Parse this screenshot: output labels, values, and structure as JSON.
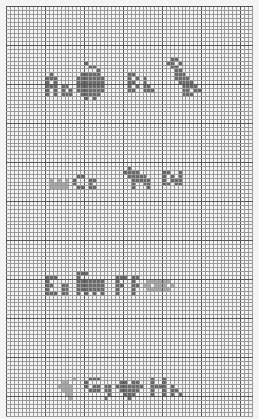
{
  "pattern": {
    "title": "Cross-stitch alphabet sampler A–H",
    "grid": {
      "cols": 63,
      "rows": 105,
      "cell_px": 3.9,
      "origin_x": 6,
      "origin_y": 6,
      "minor_line_color": "#9a9a9a",
      "major_line_color": "#555555",
      "major_every": 10,
      "background": "#f4f4f4"
    },
    "stitch_colors": {
      "dark": "#6a6a6a",
      "medium": "#8a8a8a",
      "light": "#a9a9a9"
    },
    "motifs": [
      {
        "letter_pair": "Aa",
        "picture": "apple",
        "picture_icon": "apple-icon"
      },
      {
        "letter_pair": "Bb",
        "picture": "bird",
        "picture_icon": "bird-icon"
      },
      {
        "letter_pair": "Cc",
        "picture": "crown",
        "picture_icon": "crown-icon"
      },
      {
        "letter_pair": "Dd",
        "picture": "dog",
        "picture_icon": "dog-icon"
      },
      {
        "letter_pair": "Ee",
        "picture": "elephant",
        "picture_icon": "elephant-icon"
      },
      {
        "letter_pair": "Ff",
        "picture": "fish",
        "picture_icon": "fish-icon"
      },
      {
        "letter_pair": "Gg",
        "picture": "grapes",
        "picture_icon": "grapes-icon"
      },
      {
        "letter_pair": "Hh",
        "picture": "heart",
        "picture_icon": "heart-icon"
      }
    ],
    "stitches": [
      {
        "color": "dark",
        "cells": [
          [
            11,
            17
          ],
          [
            11,
            18
          ],
          [
            10,
            18
          ],
          [
            12,
            18
          ],
          [
            10,
            19
          ],
          [
            12,
            19
          ],
          [
            10,
            20
          ],
          [
            11,
            20
          ],
          [
            12,
            20
          ],
          [
            10,
            21
          ],
          [
            12,
            21
          ],
          [
            10,
            22
          ],
          [
            12,
            22
          ],
          [
            14,
            20
          ],
          [
            15,
            20
          ],
          [
            14,
            21
          ],
          [
            16,
            21
          ],
          [
            14,
            22
          ],
          [
            15,
            22
          ],
          [
            16,
            22
          ],
          [
            20,
            14
          ],
          [
            21,
            15
          ],
          [
            22,
            15
          ],
          [
            23,
            16
          ],
          [
            19,
            17
          ],
          [
            20,
            17
          ],
          [
            21,
            17
          ],
          [
            22,
            17
          ],
          [
            23,
            17
          ],
          [
            18,
            18
          ],
          [
            19,
            18
          ],
          [
            20,
            18
          ],
          [
            21,
            18
          ],
          [
            22,
            18
          ],
          [
            23,
            18
          ],
          [
            24,
            18
          ],
          [
            18,
            19
          ],
          [
            19,
            19
          ],
          [
            20,
            19
          ],
          [
            21,
            19
          ],
          [
            22,
            19
          ],
          [
            23,
            19
          ],
          [
            24,
            19
          ],
          [
            18,
            20
          ],
          [
            19,
            20
          ],
          [
            20,
            20
          ],
          [
            21,
            20
          ],
          [
            22,
            20
          ],
          [
            23,
            20
          ],
          [
            24,
            20
          ],
          [
            18,
            21
          ],
          [
            19,
            21
          ],
          [
            20,
            21
          ],
          [
            21,
            21
          ],
          [
            22,
            21
          ],
          [
            23,
            21
          ],
          [
            24,
            21
          ],
          [
            19,
            22
          ],
          [
            20,
            22
          ],
          [
            21,
            22
          ],
          [
            22,
            22
          ],
          [
            23,
            22
          ],
          [
            20,
            23
          ],
          [
            22,
            23
          ]
        ]
      },
      {
        "color": "dark",
        "cells": [
          [
            31,
            17
          ],
          [
            32,
            17
          ],
          [
            31,
            18
          ],
          [
            33,
            18
          ],
          [
            31,
            19
          ],
          [
            32,
            19
          ],
          [
            31,
            20
          ],
          [
            33,
            20
          ],
          [
            31,
            21
          ],
          [
            32,
            21
          ],
          [
            35,
            18
          ],
          [
            35,
            19
          ],
          [
            36,
            20
          ],
          [
            35,
            20
          ],
          [
            35,
            21
          ],
          [
            37,
            21
          ],
          [
            36,
            21
          ],
          [
            42,
            13
          ],
          [
            43,
            13
          ],
          [
            41,
            14
          ],
          [
            42,
            14
          ],
          [
            44,
            14
          ],
          [
            42,
            15
          ],
          [
            43,
            15
          ],
          [
            43,
            16
          ],
          [
            44,
            16
          ],
          [
            43,
            17
          ],
          [
            44,
            17
          ],
          [
            45,
            17
          ],
          [
            43,
            18
          ],
          [
            44,
            18
          ],
          [
            45,
            18
          ],
          [
            46,
            18
          ],
          [
            44,
            19
          ],
          [
            45,
            19
          ],
          [
            46,
            19
          ],
          [
            47,
            19
          ],
          [
            45,
            20
          ],
          [
            46,
            20
          ],
          [
            47,
            20
          ],
          [
            48,
            20
          ],
          [
            45,
            21
          ],
          [
            46,
            21
          ],
          [
            48,
            21
          ],
          [
            49,
            21
          ],
          [
            45,
            22
          ],
          [
            46,
            22
          ],
          [
            47,
            22
          ]
        ]
      },
      {
        "color": "light",
        "cells": [
          [
            11,
            44
          ],
          [
            13,
            44
          ],
          [
            15,
            44
          ],
          [
            11,
            45
          ],
          [
            12,
            45
          ],
          [
            13,
            45
          ],
          [
            14,
            45
          ],
          [
            15,
            45
          ],
          [
            11,
            46
          ],
          [
            12,
            46
          ],
          [
            13,
            46
          ],
          [
            14,
            46
          ],
          [
            15,
            46
          ]
        ]
      },
      {
        "color": "dark",
        "cells": [
          [
            18,
            43
          ],
          [
            19,
            43
          ],
          [
            17,
            44
          ],
          [
            17,
            45
          ],
          [
            18,
            46
          ],
          [
            19,
            46
          ],
          [
            21,
            44
          ],
          [
            22,
            44
          ],
          [
            21,
            45
          ],
          [
            21,
            46
          ],
          [
            22,
            46
          ]
        ]
      },
      {
        "color": "dark",
        "cells": [
          [
            31,
            41
          ],
          [
            30,
            42
          ],
          [
            31,
            42
          ],
          [
            32,
            42
          ],
          [
            33,
            42
          ],
          [
            31,
            43
          ],
          [
            32,
            43
          ],
          [
            33,
            43
          ],
          [
            34,
            43
          ],
          [
            35,
            43
          ],
          [
            32,
            44
          ],
          [
            33,
            44
          ],
          [
            34,
            44
          ],
          [
            35,
            44
          ],
          [
            36,
            44
          ],
          [
            32,
            45
          ],
          [
            35,
            45
          ],
          [
            36,
            45
          ],
          [
            32,
            46
          ],
          [
            36,
            46
          ],
          [
            40,
            42
          ],
          [
            40,
            43
          ],
          [
            41,
            42
          ],
          [
            42,
            43
          ],
          [
            40,
            44
          ],
          [
            42,
            44
          ],
          [
            40,
            45
          ],
          [
            41,
            45
          ],
          [
            44,
            42
          ],
          [
            44,
            43
          ],
          [
            44,
            44
          ],
          [
            43,
            44
          ],
          [
            44,
            45
          ],
          [
            43,
            45
          ]
        ]
      },
      {
        "color": "dark",
        "cells": [
          [
            10,
            69
          ],
          [
            11,
            69
          ],
          [
            12,
            69
          ],
          [
            10,
            70
          ],
          [
            10,
            71
          ],
          [
            11,
            71
          ],
          [
            10,
            72
          ],
          [
            10,
            73
          ],
          [
            11,
            73
          ],
          [
            12,
            73
          ],
          [
            14,
            71
          ],
          [
            15,
            71
          ],
          [
            14,
            72
          ],
          [
            15,
            72
          ],
          [
            14,
            73
          ],
          [
            15,
            73
          ],
          [
            18,
            68
          ],
          [
            19,
            68
          ],
          [
            20,
            68
          ],
          [
            18,
            69
          ],
          [
            18,
            70
          ],
          [
            19,
            70
          ],
          [
            20,
            70
          ],
          [
            21,
            70
          ],
          [
            22,
            70
          ],
          [
            23,
            70
          ],
          [
            24,
            70
          ],
          [
            18,
            71
          ],
          [
            19,
            71
          ],
          [
            20,
            71
          ],
          [
            21,
            71
          ],
          [
            22,
            71
          ],
          [
            23,
            71
          ],
          [
            24,
            71
          ],
          [
            18,
            72
          ],
          [
            19,
            72
          ],
          [
            20,
            72
          ],
          [
            21,
            72
          ],
          [
            22,
            72
          ],
          [
            23,
            72
          ],
          [
            24,
            72
          ],
          [
            18,
            73
          ],
          [
            20,
            73
          ],
          [
            22,
            73
          ],
          [
            24,
            73
          ]
        ]
      },
      {
        "color": "dark",
        "cells": [
          [
            28,
            69
          ],
          [
            29,
            69
          ],
          [
            30,
            69
          ],
          [
            28,
            70
          ],
          [
            28,
            71
          ],
          [
            29,
            71
          ],
          [
            28,
            72
          ],
          [
            28,
            73
          ],
          [
            32,
            69
          ],
          [
            33,
            69
          ],
          [
            32,
            70
          ],
          [
            32,
            71
          ],
          [
            33,
            71
          ],
          [
            32,
            72
          ],
          [
            32,
            73
          ]
        ]
      },
      {
        "color": "light",
        "cells": [
          [
            36,
            70
          ],
          [
            37,
            70
          ],
          [
            38,
            70
          ],
          [
            39,
            70
          ],
          [
            40,
            70
          ],
          [
            41,
            70
          ],
          [
            35,
            71
          ],
          [
            36,
            71
          ],
          [
            38,
            71
          ],
          [
            39,
            71
          ],
          [
            40,
            71
          ],
          [
            42,
            71
          ],
          [
            36,
            72
          ],
          [
            37,
            72
          ],
          [
            38,
            72
          ],
          [
            39,
            72
          ],
          [
            40,
            72
          ],
          [
            41,
            72
          ]
        ]
      },
      {
        "color": "light",
        "cells": [
          [
            14,
            96
          ],
          [
            15,
            96
          ],
          [
            13,
            97
          ],
          [
            14,
            97
          ],
          [
            15,
            97
          ],
          [
            16,
            97
          ],
          [
            14,
            98
          ],
          [
            15,
            98
          ],
          [
            16,
            98
          ],
          [
            15,
            99
          ],
          [
            16,
            99
          ],
          [
            16,
            100
          ],
          [
            17,
            95
          ]
        ]
      },
      {
        "color": "dark",
        "cells": [
          [
            21,
            95
          ],
          [
            22,
            95
          ],
          [
            23,
            95
          ],
          [
            20,
            96
          ],
          [
            20,
            97
          ],
          [
            22,
            97
          ],
          [
            23,
            97
          ],
          [
            21,
            98
          ],
          [
            22,
            98
          ],
          [
            23,
            98
          ],
          [
            25,
            97
          ],
          [
            26,
            97
          ],
          [
            25,
            98
          ],
          [
            26,
            98
          ],
          [
            26,
            99
          ],
          [
            25,
            100
          ]
        ]
      },
      {
        "color": "dark",
        "cells": [
          [
            29,
            96
          ],
          [
            30,
            96
          ],
          [
            32,
            96
          ],
          [
            33,
            96
          ],
          [
            28,
            97
          ],
          [
            29,
            97
          ],
          [
            30,
            97
          ],
          [
            31,
            97
          ],
          [
            32,
            97
          ],
          [
            33,
            97
          ],
          [
            34,
            97
          ],
          [
            29,
            98
          ],
          [
            30,
            98
          ],
          [
            31,
            98
          ],
          [
            32,
            98
          ],
          [
            33,
            98
          ],
          [
            30,
            99
          ],
          [
            31,
            99
          ],
          [
            32,
            99
          ],
          [
            31,
            100
          ],
          [
            37,
            95
          ],
          [
            37,
            96
          ],
          [
            37,
            97
          ],
          [
            38,
            97
          ],
          [
            39,
            97
          ],
          [
            40,
            95
          ],
          [
            40,
            96
          ],
          [
            40,
            97
          ],
          [
            37,
            98
          ],
          [
            40,
            98
          ],
          [
            37,
            99
          ],
          [
            40,
            99
          ],
          [
            42,
            97
          ],
          [
            42,
            98
          ],
          [
            43,
            98
          ],
          [
            42,
            99
          ],
          [
            44,
            99
          ]
        ]
      }
    ]
  }
}
